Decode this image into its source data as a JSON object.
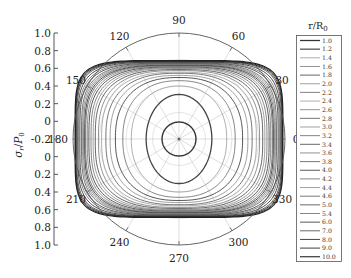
{
  "chart_data": {
    "type": "polar-line",
    "title": "",
    "ylabel": "σr/P0",
    "ylabel_main": "σ",
    "ylabel_sub": "r",
    "ylabel_den": "P",
    "ylabel_den_sub": "0",
    "radial_axis": {
      "ticks": [
        "1.0",
        "0.8",
        "0.6",
        "0.4",
        "0.2",
        "0",
        "-0.2",
        "0",
        "0.2",
        "0.4",
        "0.6",
        "0.8",
        "1.0"
      ]
    },
    "angular_ticks": [
      "0",
      "30",
      "60",
      "90",
      "120",
      "150",
      "180",
      "210",
      "240",
      "270",
      "300",
      "330"
    ],
    "legend_title_main": "r/R",
    "legend_title_sub": "0",
    "legend_position": "right",
    "series": [
      {
        "name": "1.0",
        "a": 0.16,
        "b": 0.16,
        "n": 2.0,
        "color": "#333333",
        "width": 1.4
      },
      {
        "name": "1.2",
        "a": 0.31,
        "b": 0.42,
        "n": 2.0,
        "color": "#444444",
        "width": 1.3
      },
      {
        "name": "1.4",
        "a": 0.45,
        "b": 0.5,
        "n": 2.2,
        "color": "#999999",
        "width": 0.8
      },
      {
        "name": "1.6",
        "a": 0.53,
        "b": 0.55,
        "n": 2.3,
        "color": "#777777",
        "width": 0.9
      },
      {
        "name": "1.8",
        "a": 0.6,
        "b": 0.58,
        "n": 2.4,
        "color": "#555555",
        "width": 1.0
      },
      {
        "name": "2.0",
        "a": 0.65,
        "b": 0.6,
        "n": 2.5,
        "color": "#888888",
        "width": 0.8
      },
      {
        "name": "2.2",
        "a": 0.69,
        "b": 0.62,
        "n": 2.6,
        "color": "#666666",
        "width": 0.9
      },
      {
        "name": "2.4",
        "a": 0.73,
        "b": 0.63,
        "n": 2.7,
        "color": "#999999",
        "width": 0.8
      },
      {
        "name": "2.6",
        "a": 0.76,
        "b": 0.645,
        "n": 2.8,
        "color": "#777777",
        "width": 0.8
      },
      {
        "name": "2.8",
        "a": 0.79,
        "b": 0.655,
        "n": 2.9,
        "color": "#555555",
        "width": 0.9
      },
      {
        "name": "3.0",
        "a": 0.81,
        "b": 0.665,
        "n": 3.0,
        "color": "#888888",
        "width": 0.8
      },
      {
        "name": "3.2",
        "a": 0.83,
        "b": 0.672,
        "n": 3.1,
        "color": "#666666",
        "width": 0.8
      },
      {
        "name": "3.4",
        "a": 0.85,
        "b": 0.68,
        "n": 3.2,
        "color": "#444444",
        "width": 0.9
      },
      {
        "name": "3.6",
        "a": 0.865,
        "b": 0.686,
        "n": 3.3,
        "color": "#777777",
        "width": 0.8
      },
      {
        "name": "3.8",
        "a": 0.88,
        "b": 0.692,
        "n": 3.4,
        "color": "#555555",
        "width": 0.8
      },
      {
        "name": "4.0",
        "a": 0.89,
        "b": 0.697,
        "n": 3.5,
        "color": "#333333",
        "width": 0.9
      },
      {
        "name": "4.2",
        "a": 0.9,
        "b": 0.702,
        "n": 3.6,
        "color": "#666666",
        "width": 0.8
      },
      {
        "name": "4.4",
        "a": 0.91,
        "b": 0.706,
        "n": 3.7,
        "color": "#888888",
        "width": 0.8
      },
      {
        "name": "4.6",
        "a": 0.92,
        "b": 0.71,
        "n": 3.8,
        "color": "#555555",
        "width": 0.8
      },
      {
        "name": "5.0",
        "a": 0.935,
        "b": 0.716,
        "n": 4.0,
        "color": "#444444",
        "width": 0.9
      },
      {
        "name": "5.4",
        "a": 0.945,
        "b": 0.72,
        "n": 4.2,
        "color": "#666666",
        "width": 0.8
      },
      {
        "name": "6.0",
        "a": 0.955,
        "b": 0.725,
        "n": 4.5,
        "color": "#333333",
        "width": 0.9
      },
      {
        "name": "7.0",
        "a": 0.965,
        "b": 0.73,
        "n": 4.8,
        "color": "#444444",
        "width": 0.9
      },
      {
        "name": "8.0",
        "a": 0.972,
        "b": 0.733,
        "n": 5.0,
        "color": "#333333",
        "width": 1.0
      },
      {
        "name": "9.0",
        "a": 0.977,
        "b": 0.736,
        "n": 5.2,
        "color": "#2a2a2a",
        "width": 1.0
      },
      {
        "name": "10.0",
        "a": 0.98,
        "b": 0.74,
        "n": 5.4,
        "color": "#222222",
        "width": 1.2
      }
    ]
  }
}
